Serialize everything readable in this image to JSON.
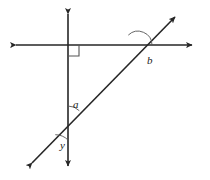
{
  "figure": {
    "type": "geometry-diagram",
    "width": 210,
    "height": 180,
    "background_color": "#ffffff",
    "stroke_color": "#262626",
    "arc_color": "#555555",
    "label_color": "#1a1a1a",
    "line_width": 1.6
  },
  "lines": [
    {
      "name": "horizontal-line",
      "kind": "double-headed-arrow",
      "x1": 10,
      "y1": 45,
      "x2": 198,
      "y2": 45
    },
    {
      "name": "vertical-line",
      "kind": "double-headed-arrow",
      "x1": 68,
      "y1": 8,
      "x2": 68,
      "y2": 172
    },
    {
      "name": "diagonal-line",
      "kind": "double-headed-arrow",
      "x1": 27,
      "y1": 168,
      "x2": 180,
      "y2": 12
    }
  ],
  "intersections": [
    {
      "name": "vertical-horizontal",
      "x": 68,
      "y": 45,
      "marker": "right-angle-square"
    },
    {
      "name": "diagonal-horizontal",
      "x": 138,
      "y": 45,
      "marker": "arc"
    },
    {
      "name": "diagonal-vertical",
      "x": 122,
      "y": 122,
      "marker": "arc"
    }
  ],
  "right_angle": {
    "name": "right-angle-mark",
    "x": 68,
    "y": 45,
    "size": 11,
    "direction": "down-right",
    "degrees": 90
  },
  "labels": [
    {
      "name": "angle-label-a",
      "text": "a",
      "x": 73,
      "y": 99
    },
    {
      "name": "angle-label-b",
      "text": "b",
      "x": 147,
      "y": 55
    },
    {
      "name": "angle-label-y",
      "text": "y",
      "x": 60,
      "y": 140
    }
  ],
  "arcs": [
    {
      "name": "arc-a",
      "cx": 68,
      "cy": 122,
      "r": 16,
      "start_deg": 270,
      "end_deg": 314
    },
    {
      "name": "arc-b",
      "cx": 138,
      "cy": 45,
      "r": 14,
      "start_deg": 0,
      "end_deg": 134
    },
    {
      "name": "arc-y",
      "cx": 68,
      "cy": 122,
      "r": 22,
      "start_deg": 90,
      "end_deg": 134
    }
  ]
}
